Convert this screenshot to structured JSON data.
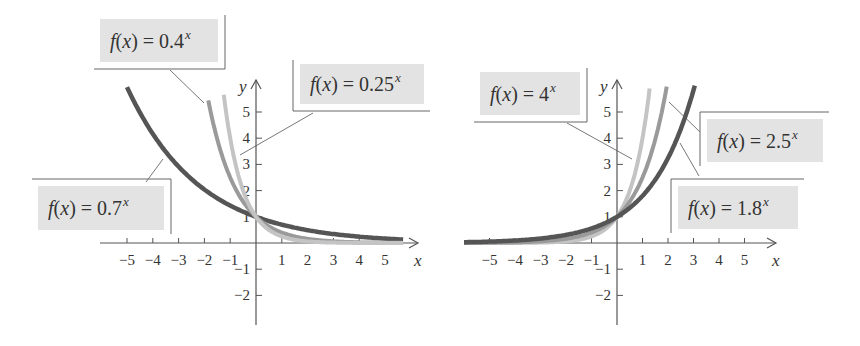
{
  "chart_data": [
    {
      "type": "line",
      "title": "",
      "xlabel": "x",
      "ylabel": "y",
      "xlim": [
        -5.9,
        6.2
      ],
      "ylim": [
        -3.2,
        6.2
      ],
      "xticks": [
        -5,
        -4,
        -3,
        -2,
        -1,
        1,
        2,
        3,
        4,
        5
      ],
      "yticks": [
        -2,
        -1,
        1,
        2,
        3,
        4,
        5
      ],
      "grid": false,
      "origin_px": [
        256,
        243
      ],
      "unit_px": [
        25.8,
        26.2
      ],
      "x_axis_px": [
        100,
        418
      ],
      "y_axis_px": [
        80,
        325
      ],
      "series": [
        {
          "name": "f(x) = 0.7^x",
          "base": 0.7,
          "color": "#555555",
          "width": 4.5,
          "x_range": [
            -5,
            5.7
          ]
        },
        {
          "name": "f(x) = 0.4^x",
          "base": 0.4,
          "color": "#9a9a9a",
          "width": 4,
          "x_range": [
            -1.85,
            5.7
          ]
        },
        {
          "name": "f(x) = 0.25^x",
          "base": 0.25,
          "color": "#c4c4c4",
          "width": 4,
          "x_range": [
            -1.25,
            5.7
          ]
        }
      ],
      "annotations": [
        {
          "id": "l07",
          "prefix": "f(x) = 0.7",
          "sup": "x",
          "box": [
            38,
            186,
            126,
            44
          ],
          "bracket": "tr",
          "leader": [
            [
              146,
              182
            ],
            [
              163,
              159
            ]
          ]
        },
        {
          "id": "l04",
          "prefix": "f(x) = 0.4",
          "sup": "x",
          "box": [
            100,
            19,
            118,
            43
          ],
          "bracket": "br",
          "leader": [
            [
              170,
              70
            ],
            [
              204,
              103
            ]
          ]
        },
        {
          "id": "l025",
          "prefix": "f(x) = 0.25",
          "sup": "x",
          "box": [
            300,
            64,
            124,
            40
          ],
          "bracket": "bl",
          "leader": [
            [
              313,
              113
            ],
            [
              240,
              155
            ]
          ]
        }
      ]
    },
    {
      "type": "line",
      "title": "",
      "xlabel": "x",
      "ylabel": "y",
      "xlim": [
        -6,
        6.2
      ],
      "ylim": [
        -3.2,
        6.2
      ],
      "xticks": [
        -5,
        -4,
        -3,
        -2,
        -1,
        1,
        2,
        3,
        4,
        5
      ],
      "yticks": [
        -2,
        -1,
        1,
        2,
        3,
        4,
        5
      ],
      "grid": false,
      "origin_px": [
        617,
        243
      ],
      "unit_px": [
        25.5,
        26.2
      ],
      "x_axis_px": [
        464,
        776
      ],
      "y_axis_px": [
        80,
        325
      ],
      "series": [
        {
          "name": "f(x) = 4^x",
          "base": 4,
          "color": "#c4c4c4",
          "width": 4,
          "x_range": [
            -6,
            1.28
          ]
        },
        {
          "name": "f(x) = 2.5^x",
          "base": 2.5,
          "color": "#9a9a9a",
          "width": 4,
          "x_range": [
            -6,
            1.95
          ]
        },
        {
          "name": "f(x) = 1.8^x",
          "base": 1.8,
          "color": "#555555",
          "width": 4.5,
          "x_range": [
            -6,
            3.05
          ]
        }
      ],
      "annotations": [
        {
          "id": "l4",
          "prefix": "f(x) = 4",
          "sup": "x",
          "box": [
            480,
            72,
            100,
            43
          ],
          "bracket": "br",
          "leader": [
            [
              567,
              123
            ],
            [
              632,
              159
            ]
          ]
        },
        {
          "id": "l25",
          "prefix": "f(x) = 2.5",
          "sup": "x",
          "box": [
            707,
            119,
            116,
            43
          ],
          "bracket": "tl",
          "leader": [
            [
              700,
              132
            ],
            [
              669,
              102
            ]
          ]
        },
        {
          "id": "l18",
          "prefix": "f(x) = 1.8",
          "sup": "x",
          "box": [
            678,
            186,
            120,
            43
          ],
          "bracket": "tl",
          "leader": [
            [
              699,
              176
            ],
            [
              680,
              143
            ]
          ]
        }
      ]
    }
  ],
  "panels": {
    "left": {
      "labels": {
        "f07": {
          "text": "f(x) = 0.7",
          "sup": "x"
        },
        "f04": {
          "text": "f(x) = 0.4",
          "sup": "x"
        },
        "f025": {
          "text": "f(x) = 0.25",
          "sup": "x"
        }
      },
      "axis": {
        "x": "x",
        "y": "y"
      }
    },
    "right": {
      "labels": {
        "f4": {
          "text": "f(x) = 4",
          "sup": "x"
        },
        "f25": {
          "text": "f(x) = 2.5",
          "sup": "x"
        },
        "f18": {
          "text": "f(x) = 1.8",
          "sup": "x"
        }
      },
      "axis": {
        "x": "x",
        "y": "y"
      }
    }
  },
  "style": {
    "axis_color": "#555555",
    "label_fill": "#e3e3e3",
    "bracket_color": "#666666",
    "leader_color": "#777777"
  }
}
